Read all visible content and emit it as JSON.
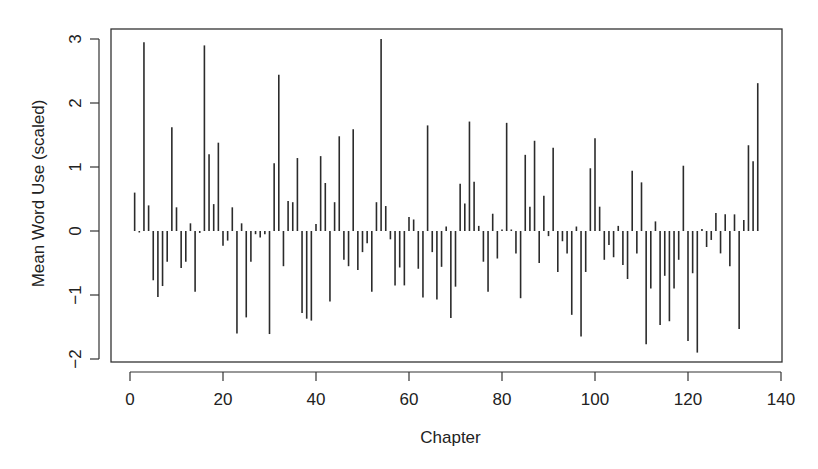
{
  "chart_data": {
    "type": "bar",
    "subtype": "histogram-style vertical lines (R type='h')",
    "title": "",
    "xlabel": "Chapter",
    "ylabel": "Mean Word Use (scaled)",
    "xlim": [
      0,
      140
    ],
    "ylim": [
      -2,
      3
    ],
    "xticks": [
      0,
      20,
      40,
      60,
      80,
      100,
      120,
      140
    ],
    "yticks": [
      -2,
      -1,
      0,
      1,
      2,
      3
    ],
    "grid": false,
    "legend": null,
    "x": [
      1,
      2,
      3,
      4,
      5,
      6,
      7,
      8,
      9,
      10,
      11,
      12,
      13,
      14,
      15,
      16,
      17,
      18,
      19,
      20,
      21,
      22,
      23,
      24,
      25,
      26,
      27,
      28,
      29,
      30,
      31,
      32,
      33,
      34,
      35,
      36,
      37,
      38,
      39,
      40,
      41,
      42,
      43,
      44,
      45,
      46,
      47,
      48,
      49,
      50,
      51,
      52,
      53,
      54,
      55,
      56,
      57,
      58,
      59,
      60,
      61,
      62,
      63,
      64,
      65,
      66,
      67,
      68,
      69,
      70,
      71,
      72,
      73,
      74,
      75,
      76,
      77,
      78,
      79,
      80,
      81,
      82,
      83,
      84,
      85,
      86,
      87,
      88,
      89,
      90,
      91,
      92,
      93,
      94,
      95,
      96,
      97,
      98,
      99,
      100,
      101,
      102,
      103,
      104,
      105,
      106,
      107,
      108,
      109,
      110,
      111,
      112,
      113,
      114,
      115,
      116,
      117,
      118,
      119,
      120,
      121,
      122,
      123,
      124,
      125,
      126,
      127,
      128,
      129,
      130,
      131,
      132,
      133,
      134,
      135
    ],
    "values": [
      0.6,
      -0.02,
      2.95,
      0.4,
      -0.77,
      -1.03,
      -0.86,
      -0.48,
      1.62,
      0.37,
      -0.58,
      -0.48,
      0.12,
      -0.95,
      -0.03,
      2.9,
      1.2,
      0.42,
      1.38,
      -0.23,
      -0.15,
      0.37,
      -1.6,
      0.12,
      -1.35,
      -0.48,
      -0.05,
      -0.1,
      -0.05,
      -1.61,
      1.06,
      2.44,
      -0.55,
      0.47,
      0.45,
      1.14,
      -1.28,
      -1.37,
      -1.4,
      0.11,
      1.17,
      0.75,
      -1.1,
      0.45,
      1.48,
      -0.45,
      -0.55,
      1.59,
      -0.61,
      -0.33,
      -0.19,
      -0.95,
      0.45,
      3.0,
      0.39,
      -0.13,
      -0.85,
      -0.57,
      -0.85,
      0.22,
      0.18,
      -0.59,
      -1.04,
      1.65,
      -0.33,
      -1.07,
      -0.56,
      0.07,
      -1.36,
      -0.87,
      0.74,
      0.43,
      1.71,
      0.77,
      0.08,
      -0.48,
      -0.95,
      0.27,
      -0.43,
      0.01,
      1.69,
      0.02,
      -0.35,
      -1.05,
      1.19,
      0.38,
      1.41,
      -0.5,
      0.55,
      -0.08,
      1.3,
      -0.64,
      -0.16,
      -0.35,
      -1.31,
      0.07,
      -1.65,
      -0.64,
      0.98,
      1.45,
      0.38,
      -0.45,
      -0.22,
      -0.41,
      0.08,
      -0.53,
      -0.75,
      0.94,
      -0.35,
      0.76,
      -1.77,
      -0.9,
      0.15,
      -1.47,
      -0.7,
      -1.41,
      -0.9,
      -0.45,
      1.02,
      -1.72,
      -0.66,
      -1.9,
      0.03,
      -0.25,
      -0.14,
      0.28,
      -0.35,
      0.26,
      -0.55,
      0.26,
      -1.53,
      0.17,
      1.34,
      1.09,
      2.31
    ],
    "line_color": "#2b2b2b",
    "axis_color": "#333333"
  }
}
